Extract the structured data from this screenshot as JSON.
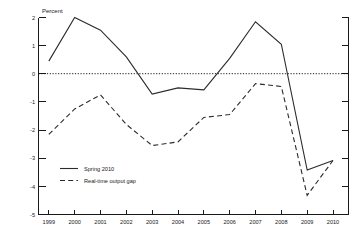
{
  "chart_data": {
    "type": "line",
    "title": "",
    "ylabel": "Percent",
    "xlabel": "",
    "ylim": [
      -5,
      2
    ],
    "xlim": [
      1998.6,
      2010.6
    ],
    "grid": false,
    "zero_line": true,
    "legend_position": "lower-left",
    "y_ticks": [
      2,
      1,
      0,
      -1,
      -2,
      -3,
      -4,
      -5
    ],
    "y_tick_labels": [
      "2",
      "1",
      "0",
      "-1",
      "-2",
      "-3",
      "-4",
      "-5"
    ],
    "categories": [
      1999,
      2000,
      2001,
      2002,
      2003,
      2004,
      2005,
      2006,
      2007,
      2008,
      2009,
      2010
    ],
    "x_tick_labels": [
      "1999",
      "2000",
      "2001",
      "2002",
      "2003",
      "2004",
      "2005",
      "2006",
      "2007",
      "2008",
      "2009",
      "2010"
    ],
    "series": [
      {
        "name": "Spring 2010",
        "style": "solid",
        "color": "#2b2b2b",
        "values": [
          0.45,
          2.0,
          1.55,
          0.6,
          -0.72,
          -0.5,
          -0.57,
          0.55,
          1.85,
          1.05,
          -3.42,
          -3.08
        ]
      },
      {
        "name": "Real-time output gap",
        "style": "dashed",
        "color": "#2b2b2b",
        "values": [
          -2.15,
          -1.25,
          -0.75,
          -1.8,
          -2.55,
          -2.42,
          -1.55,
          -1.45,
          -0.35,
          -0.45,
          -4.32,
          -3.08
        ]
      }
    ]
  },
  "legend": {
    "entries": [
      {
        "label": "Spring 2010",
        "style": "solid"
      },
      {
        "label": "Real-time output gap",
        "style": "dashed"
      }
    ]
  },
  "axis": {
    "y_title": "Percent"
  }
}
